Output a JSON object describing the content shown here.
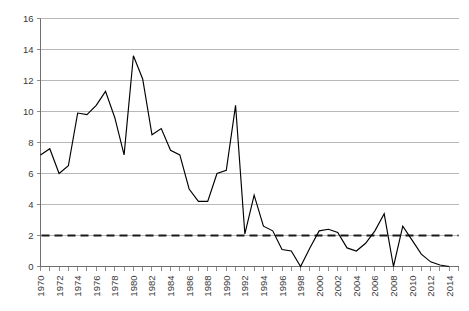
{
  "chart_data": {
    "type": "line",
    "title": "",
    "subtitle": "",
    "xlabel": "",
    "ylabel": "",
    "xlim": [
      1970,
      2015
    ],
    "ylim": [
      0,
      16
    ],
    "ytick_step": 2,
    "xtick_step": 1,
    "xtick_label_step": 2,
    "grid": "horizontal",
    "legend": "none",
    "line_color": "#000000",
    "grid_color": "#a6a6a6",
    "axis_color": "#6f6f6f",
    "x": [
      1970,
      1971,
      1972,
      1973,
      1974,
      1975,
      1976,
      1977,
      1978,
      1979,
      1980,
      1981,
      1982,
      1983,
      1984,
      1985,
      1986,
      1987,
      1988,
      1989,
      1990,
      1991,
      1992,
      1993,
      1994,
      1995,
      1996,
      1997,
      1998,
      1999,
      2000,
      2001,
      2002,
      2003,
      2004,
      2005,
      2006,
      2007,
      2008,
      2009,
      2010,
      2011,
      2012,
      2013,
      2014
    ],
    "values": [
      7.2,
      7.6,
      6.0,
      6.5,
      9.9,
      9.8,
      10.4,
      11.3,
      9.6,
      7.2,
      13.6,
      12.1,
      8.5,
      8.9,
      7.5,
      7.2,
      5.0,
      4.2,
      4.2,
      6.0,
      6.2,
      10.4,
      2.1,
      4.6,
      2.6,
      2.3,
      1.1,
      1.0,
      0.0,
      1.2,
      2.3,
      2.4,
      2.2,
      1.2,
      1.0,
      1.5,
      2.3,
      3.4,
      0.0,
      2.6,
      1.7,
      0.8,
      0.3,
      0.1,
      0.0
    ],
    "ytick_labels": [
      "0",
      "2",
      "4",
      "6",
      "8",
      "10",
      "12",
      "14",
      "16"
    ],
    "ytick_values": [
      0,
      2,
      4,
      6,
      8,
      10,
      12,
      14,
      16
    ],
    "xtick_labels": [
      "1970",
      "1972",
      "1974",
      "1976",
      "1978",
      "1980",
      "1982",
      "1984",
      "1986",
      "1988",
      "1990",
      "1992",
      "1994",
      "1996",
      "1998",
      "2000",
      "2002",
      "2004",
      "2006",
      "2008",
      "2010",
      "2012",
      "2014"
    ],
    "xtick_label_values": [
      1970,
      1972,
      1974,
      1976,
      1978,
      1980,
      1982,
      1984,
      1986,
      1988,
      1990,
      1992,
      1994,
      1996,
      1998,
      2000,
      2002,
      2004,
      2006,
      2008,
      2010,
      2012,
      2014
    ],
    "annotations": [
      {
        "name": "threshold-line",
        "type": "horizontal-reference-line",
        "value": 2,
        "style": "dashed",
        "color": "#1a1a1a",
        "label": ""
      }
    ]
  }
}
